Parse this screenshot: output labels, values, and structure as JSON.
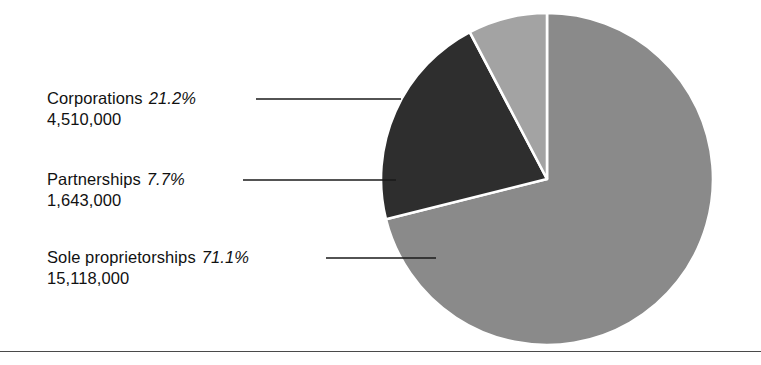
{
  "figure": {
    "background_color": "#ffffff",
    "rule_color": "#4a4a4a"
  },
  "chart_data": {
    "type": "pie",
    "title": "",
    "xlabel": "",
    "ylabel": "",
    "legend_position": "left-callout-labels",
    "grid": false,
    "start_angle_deg": 0,
    "direction": "clockwise",
    "categories": [
      "Sole proprietorships",
      "Partnerships",
      "Corporations"
    ],
    "values": [
      15118000,
      1643000,
      4510000
    ],
    "percentages": [
      71.1,
      7.7,
      21.2
    ],
    "value_labels": [
      "15,118,000",
      "1,643,000",
      "4,510,000"
    ],
    "percent_labels": [
      "71.1%",
      "7.7%",
      "21.2%"
    ],
    "colors": [
      "#8a8a8a",
      "#a3a3a3",
      "#2e2e2e"
    ],
    "slice_order_clockwise_from_12": [
      "Sole proprietorships",
      "Corporations",
      "Partnerships"
    ],
    "total": 21271000
  },
  "callouts": [
    {
      "name": "Corporations",
      "percent": "21.2%",
      "value": "4,510,000",
      "color": "#2e2e2e"
    },
    {
      "name": "Partnerships",
      "percent": "7.7%",
      "value": "1,643,000",
      "color": "#a3a3a3"
    },
    {
      "name": "Sole proprietorships",
      "percent": "71.1%",
      "value": "15,118,000",
      "color": "#8a8a8a"
    }
  ]
}
